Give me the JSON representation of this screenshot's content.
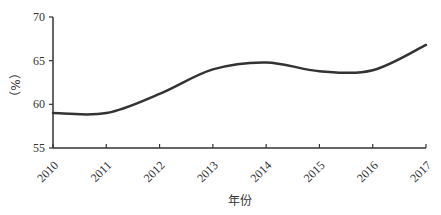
{
  "chart_data": {
    "type": "line",
    "title": "",
    "xlabel": "年份",
    "ylabel": "（%）",
    "x": [
      "2010",
      "2011",
      "2012",
      "2013",
      "2014",
      "2015",
      "2016",
      "2017"
    ],
    "series": [
      {
        "name": "",
        "values": [
          59.0,
          59.0,
          61.2,
          64.0,
          64.8,
          63.8,
          63.9,
          66.8
        ],
        "color": "#333333"
      }
    ],
    "ylim": [
      55,
      70
    ],
    "yticks": [
      55,
      60,
      65,
      70
    ],
    "grid": false,
    "legend": "none",
    "smooth": true
  }
}
